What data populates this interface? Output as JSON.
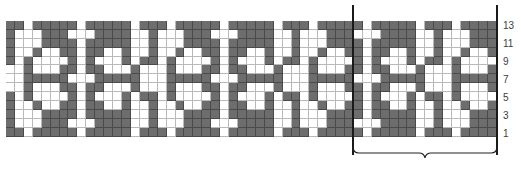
{
  "chart": {
    "rows": 13,
    "columns": 55,
    "repeat_width": 16,
    "start_offset_in_repeat": 9,
    "colors": {
      "dark": "#6d6d6d",
      "light": "#ffffff",
      "grid_light": "#b9b9b9",
      "grid_dark": "#4a4a4a",
      "line": "#1a1a1a"
    },
    "repeat_rows_top_to_bottom": [
      "DWDDDDDWDDDWDDDD",
      "WWWDDDDWWDWWWDDD",
      "DWDDDDDWWDWWWDDD",
      "DWDDWWDWWDWWDWWD",
      "DWDWWWDWDDWDWWWW",
      "DWDDWWWDWWWDWWWD",
      "WWWDDDDDWWWDDDDD",
      "DWDDWWWDWWWDWWWD",
      "DWDWWWDWDDWDWWWW",
      "DWDDWWDWWDWWDWWD",
      "DWDDDDDWWDWWWDDD",
      "WWWDDDDWWDWWWDDD",
      "DWDDDDDWDDDWDDDD"
    ]
  },
  "row_labels": [
    {
      "text": "13",
      "top": 21
    },
    {
      "text": "11",
      "top": 39
    },
    {
      "text": "9",
      "top": 57
    },
    {
      "text": "7",
      "top": 75
    },
    {
      "text": "5",
      "top": 93
    },
    {
      "text": "3",
      "top": 111
    },
    {
      "text": "1",
      "top": 129
    }
  ],
  "repeat_marker": {
    "label": "pattern repeat",
    "left": 352,
    "right": 497
  }
}
